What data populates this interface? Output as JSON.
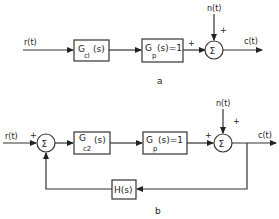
{
  "diagrams": [
    {
      "caption": "a",
      "input_label": "r(t)",
      "output_label": "c(t)",
      "disturbance_label": "n(t)",
      "controller": {
        "main": "G",
        "sub": "cl",
        "arg": "(s)"
      },
      "plant": {
        "main": "G",
        "sub": "p",
        "arg": "(s)=1"
      },
      "summer": {
        "symbol": "Σ",
        "sign_forward": "+",
        "sign_disturbance": "+"
      }
    },
    {
      "caption": "b",
      "input_label": "r(t)",
      "output_label": "c(t)",
      "disturbance_label": "n(t)",
      "controller": {
        "main": "G",
        "sub": "c2",
        "arg": "(s)"
      },
      "plant": {
        "main": "G",
        "sub": "p",
        "arg": "(s)=1"
      },
      "feedback": {
        "label": "H(s)"
      },
      "summer_input": {
        "symbol": "Σ",
        "sign_reference": "+"
      },
      "summer_output": {
        "symbol": "Σ",
        "sign_forward": "+",
        "sign_disturbance": "+"
      }
    }
  ]
}
